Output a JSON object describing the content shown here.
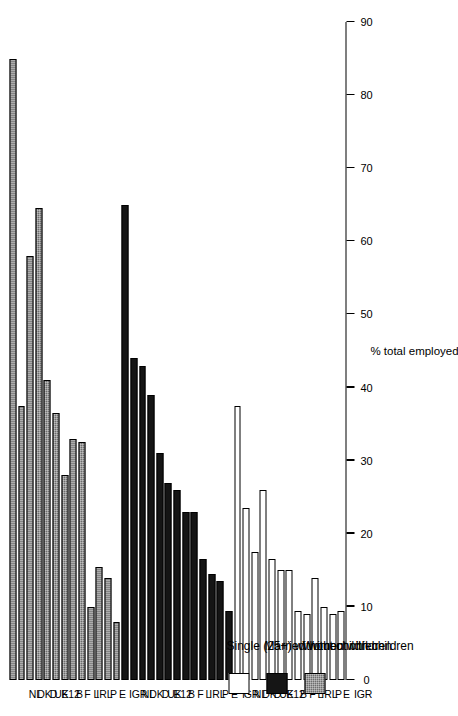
{
  "chart_data": {
    "type": "bar",
    "title": "",
    "xlabel": "",
    "ylabel": "% total employed",
    "ylim": [
      0,
      90
    ],
    "ytick_step": 10,
    "yticks": [
      "0",
      "10",
      "20",
      "30",
      "40",
      "50",
      "60",
      "70",
      "80",
      "90"
    ],
    "grid": false,
    "orientation": "horizontal-rotated",
    "legend_position": "bottom-left",
    "categories": [
      "GR",
      "I",
      "E",
      "P",
      "IRL",
      "L",
      "F",
      "B",
      "E12",
      "UK",
      "D",
      "DK",
      "NL"
    ],
    "series": [
      {
        "name": "Single (25+) without children",
        "fill": "white",
        "values": [
          9.5,
          9,
          10,
          14,
          9,
          9.5,
          15,
          15,
          16.5,
          26,
          17.5,
          23.5,
          37.5
        ]
      },
      {
        "name": "Married without children",
        "fill": "black",
        "values": [
          9.5,
          13.5,
          14.5,
          16.5,
          23,
          23,
          26,
          27,
          31,
          39,
          43,
          44,
          65
        ]
      },
      {
        "name": "Women with children",
        "fill": "hatched-gray",
        "values": [
          8,
          14,
          15.5,
          10,
          32.5,
          33,
          28,
          36.5,
          41,
          64.5,
          58,
          37.5,
          85
        ]
      }
    ]
  },
  "legend": {
    "items": [
      {
        "label": "Single (25+) without children"
      },
      {
        "label": "Married without children"
      },
      {
        "label": "Women with children"
      }
    ]
  },
  "colors": {
    "series_1": "#ffffff",
    "series_2": "#151515",
    "series_3": "#6d6d6d",
    "axis": "#000000",
    "background": "#ffffff"
  }
}
